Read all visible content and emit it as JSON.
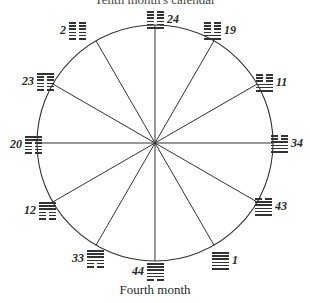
{
  "diagram": {
    "title_top": "Tenth month's calendar",
    "title_bottom": "Fourth month",
    "circle": {
      "cx": 155,
      "cy": 143,
      "r": 118,
      "stroke": "#333333"
    },
    "spokes": 12,
    "hexagrams": [
      {
        "number": "24",
        "angle": 0,
        "lines": [
          1,
          0,
          0,
          0,
          0,
          0
        ],
        "x": 147,
        "y": 11,
        "num_side": "right"
      },
      {
        "number": "19",
        "angle": 30,
        "lines": [
          1,
          1,
          0,
          0,
          0,
          0
        ],
        "x": 204,
        "y": 22,
        "num_side": "right"
      },
      {
        "number": "11",
        "angle": 60,
        "lines": [
          1,
          1,
          1,
          0,
          0,
          0
        ],
        "x": 256,
        "y": 74,
        "num_side": "right"
      },
      {
        "number": "34",
        "angle": 90,
        "lines": [
          1,
          1,
          1,
          1,
          0,
          0
        ],
        "x": 271,
        "y": 135,
        "num_side": "right"
      },
      {
        "number": "43",
        "angle": 120,
        "lines": [
          1,
          1,
          1,
          1,
          1,
          0
        ],
        "x": 255,
        "y": 198,
        "num_side": "right"
      },
      {
        "number": "1",
        "angle": 150,
        "lines": [
          1,
          1,
          1,
          1,
          1,
          1
        ],
        "x": 212,
        "y": 252,
        "num_side": "right"
      },
      {
        "number": "44",
        "angle": 180,
        "lines": [
          0,
          1,
          1,
          1,
          1,
          1
        ],
        "x": 132,
        "y": 263,
        "num_side": "left"
      },
      {
        "number": "33",
        "angle": 210,
        "lines": [
          0,
          0,
          1,
          1,
          1,
          1
        ],
        "x": 72,
        "y": 250,
        "num_side": "left"
      },
      {
        "number": "12",
        "angle": 240,
        "lines": [
          0,
          0,
          0,
          1,
          1,
          1
        ],
        "x": 24,
        "y": 202,
        "num_side": "left"
      },
      {
        "number": "20",
        "angle": 270,
        "lines": [
          0,
          0,
          0,
          0,
          1,
          1
        ],
        "x": 10,
        "y": 136,
        "num_side": "left"
      },
      {
        "number": "23",
        "angle": 300,
        "lines": [
          0,
          0,
          0,
          0,
          0,
          1
        ],
        "x": 22,
        "y": 73,
        "num_side": "left"
      },
      {
        "number": "2",
        "angle": 330,
        "lines": [
          0,
          0,
          0,
          0,
          0,
          0
        ],
        "x": 60,
        "y": 22,
        "num_side": "left"
      }
    ]
  }
}
